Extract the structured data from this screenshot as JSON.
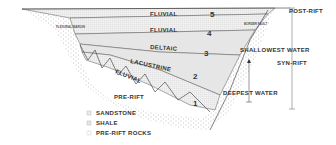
{
  "diagram": {
    "units": [
      {
        "number": "5",
        "label": "FLUVIAL"
      },
      {
        "number": "4",
        "label": "FLUVIAL"
      },
      {
        "number": "3",
        "label": "DELTAIC"
      },
      {
        "number": "2",
        "label": "LACUSTRINE"
      },
      {
        "number": "1",
        "label": "FLUVIAL"
      }
    ],
    "basement_label": "PRE-RIFT",
    "flexural_margin": "FLEXURAL MARGIN",
    "border_fault": "BORDER FAULT",
    "water_depth": {
      "top": "SHALLOWEST WATER",
      "bottom": "DEEPEST WATER"
    },
    "phases": {
      "post_rift": "POST-RIFT",
      "syn_rift": "SYN-RIFT"
    },
    "legend": [
      {
        "label": "SANDSTONE"
      },
      {
        "label": "SHALE"
      },
      {
        "label": "PRE-RIFT ROCKS"
      }
    ]
  }
}
